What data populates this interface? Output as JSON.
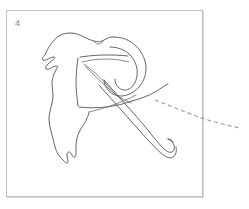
{
  "panel": {
    "index_label": "4",
    "border_color": "#bfbfbf",
    "background_color": "#ffffff",
    "shadow_color": "#d8d8d8",
    "bounds": {
      "left": 6,
      "top": 10,
      "width": 197,
      "height": 187
    }
  },
  "sketch": {
    "title": "line-art glyph sketch",
    "ink_color": "#4a4a4a",
    "soft_ink_color": "#6d6d6d",
    "dashed_color": "#9a9a9a",
    "description": "Hand-drawn outline of a stylized letter R with a torn organic left contour, a rounded bowl, a long sweeping diagonal leg ending in an upturned hook, and a dashed trajectory curve leaving the panel to the right.",
    "strokes": {
      "left_contour": "M 59 36 C 56 38 53 41 51 44 C 49 47 47 50 46 53 C 45 55 44 56 43 57 C 42 58 42 59 43 60 C 44 61 46 60 48 59 C 50 58 52 57 54 57 C 55 57 55 58 54 59 C 52 61 50 62 48 64 C 46 66 45 68 46 69 C 47 70 49 69 51 68 C 53 67 55 66 57 66 C 58 66 58 67 57 68 C 56 70 55 72 54 74 C 53 77 52 80 52 83 C 52 87 53 91 53 95 C 53 99 52 103 51 107 C 50 111 49 115 49 119 C 49 123 50 127 51 131 C 52 135 53 139 54 143 C 55 147 56 151 58 154 C 60 157 62 159 64 161 C 65 162 66 163 67 163 C 68 163 68 162 68 161 C 68 159 67 157 67 155 C 67 153 68 152 69 152 C 70 152 71 153 72 155 C 73 157 74 158 75 157 C 76 156 76 153 76 150 C 76 146 76 142 77 138 C 78 134 80 130 82 127 C 84 124 86 121 87 118 C 88 116 89 114 89 112",
      "upper_outline": "M 59 36 C 62 34 66 33 70 33 C 74 33 78 34 82 36 C 86 38 90 40 94 41 C 97 42 100 42 102 41 C 104 40 106 39 108 38 C 110 37 112 37 114 37",
      "head_notch": "M 94 41 C 95 43 96 44 98 44 C 100 44 102 43 103 41",
      "bowl_outer": "M 114 37 C 122 37 130 40 136 46 C 142 52 146 60 146 68 C 146 76 143 83 138 88 C 133 93 127 96 121 96 C 116 96 112 94 109 91 C 106 88 104 84 104 80",
      "bowl_inner": "M 110 47 C 118 47 126 50 131 56 C 136 62 138 69 137 76 C 136 82 133 87 129 89 C 125 91 121 90 118 87 C 116 85 115 82 115 79",
      "stem_box_top": "M 80 57 C 88 56 96 55 104 55 C 112 55 120 55 128 56",
      "stem_box_left": "M 78 58 C 77 66 76 74 76 82 C 76 90 77 98 78 106",
      "stem_box_bottom": "M 79 107 C 88 108 97 108 106 107 C 115 106 124 104 132 101",
      "inner_wedge_a": "M 82 62 C 90 60 98 59 106 59 C 114 59 122 60 129 62",
      "inner_wedge_b": "M 84 64 C 92 70 100 77 107 85 C 112 91 117 96 122 100",
      "inner_wedge_c": "M 85 66 C 93 74 101 82 109 89 C 116 95 123 100 131 103",
      "leg_upper": "M 104 80 C 112 89 120 98 128 107 C 136 116 144 125 151 134 C 155 139 159 144 163 148 C 166 151 169 153 172 152 C 174 151 175 148 174 145 C 173 142 171 140 168 139",
      "leg_lower": "M 99 85 C 107 94 115 103 123 112 C 131 121 139 130 147 139 C 152 144 157 150 162 154 C 166 157 170 159 173 157 C 176 155 177 151 176 147",
      "leg_flare": "M 132 101 C 140 99 148 96 155 92 C 160 89 164 86 168 84",
      "under_arc": "M 89 112 C 97 110 105 108 113 105 C 121 102 129 99 136 95",
      "tail_tip": "M 168 139 C 170 139 172 140 173 142",
      "dashed_trajectory": "M 155 100 C 168 105 182 111 196 116 C 210 121 225 125 240 128"
    }
  }
}
